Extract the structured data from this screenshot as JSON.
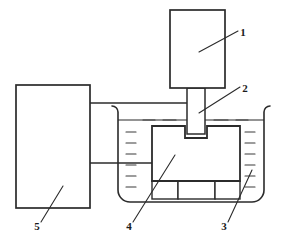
{
  "figure": {
    "kind": "technical-schematic",
    "background_color": "#ffffff",
    "line_color": "#2b2b2b",
    "fill_color": "#ffffff",
    "liquid_mark_color": "#3a3a3a"
  },
  "callouts": [
    {
      "id": "1",
      "label": "1",
      "target": "drive-unit-box",
      "text_x": 243,
      "text_y": 36,
      "leader": {
        "x1": 238,
        "y1": 31,
        "x2": 199,
        "y2": 52
      }
    },
    {
      "id": "2",
      "label": "2",
      "target": "plunger-rod",
      "text_x": 245,
      "text_y": 92,
      "leader": {
        "x1": 240,
        "y1": 87,
        "x2": 199,
        "y2": 113
      }
    },
    {
      "id": "3",
      "label": "3",
      "target": "liquid-tank",
      "text_x": 224,
      "text_y": 230,
      "leader": {
        "x1": 228,
        "y1": 222,
        "x2": 252,
        "y2": 170
      }
    },
    {
      "id": "4",
      "label": "4",
      "target": "workpiece-block",
      "text_x": 129,
      "text_y": 230,
      "leader": {
        "x1": 133,
        "y1": 222,
        "x2": 175,
        "y2": 155
      }
    },
    {
      "id": "5",
      "label": "5",
      "target": "controller-box",
      "text_x": 37,
      "text_y": 230,
      "leader": {
        "x1": 41,
        "y1": 222,
        "x2": 63,
        "y2": 186
      }
    }
  ],
  "parts": {
    "drive_unit": {
      "name": "drive-unit-box",
      "x": 170,
      "y": 10,
      "width": 55,
      "height": 78
    },
    "plunger_rod": {
      "name": "plunger-rod",
      "x": 187,
      "y": 88,
      "width": 18,
      "height": 46
    },
    "controller": {
      "name": "controller-box",
      "x": 16,
      "y": 85,
      "width": 74,
      "height": 123
    },
    "tank": {
      "name": "liquid-tank",
      "x": 118,
      "y": 112,
      "width": 146,
      "height": 90,
      "corner_radius": 12,
      "lip_radius": 6
    },
    "liquid_level_y": 120,
    "workpiece": {
      "name": "workpiece-block",
      "x": 152,
      "y": 126,
      "width": 88,
      "height": 55,
      "notch": {
        "x": 185,
        "y": 126,
        "width": 22,
        "height": 12
      }
    },
    "support_blocks": [
      {
        "x": 152,
        "y": 181,
        "width": 26,
        "height": 18
      },
      {
        "x": 178,
        "y": 181,
        "width": 37,
        "height": 18
      },
      {
        "x": 215,
        "y": 181,
        "width": 25,
        "height": 18
      }
    ],
    "connectors": [
      {
        "name": "upper-signal-line",
        "x1": 90,
        "y1": 103,
        "x2": 192,
        "y2": 103
      },
      {
        "name": "lower-signal-line",
        "x1": 90,
        "y1": 163,
        "x2": 155,
        "y2": 163
      }
    ],
    "liquid_marks": [
      {
        "x1": 126,
        "y1": 132,
        "x2": 136,
        "y2": 132
      },
      {
        "x1": 126,
        "y1": 143,
        "x2": 136,
        "y2": 143
      },
      {
        "x1": 126,
        "y1": 154,
        "x2": 136,
        "y2": 154
      },
      {
        "x1": 126,
        "y1": 165,
        "x2": 136,
        "y2": 165
      },
      {
        "x1": 126,
        "y1": 176,
        "x2": 136,
        "y2": 176
      },
      {
        "x1": 126,
        "y1": 187,
        "x2": 136,
        "y2": 187
      },
      {
        "x1": 245,
        "y1": 132,
        "x2": 255,
        "y2": 132
      },
      {
        "x1": 245,
        "y1": 143,
        "x2": 255,
        "y2": 143
      },
      {
        "x1": 245,
        "y1": 154,
        "x2": 255,
        "y2": 154
      },
      {
        "x1": 245,
        "y1": 165,
        "x2": 255,
        "y2": 165
      },
      {
        "x1": 245,
        "y1": 176,
        "x2": 255,
        "y2": 176
      },
      {
        "x1": 245,
        "y1": 187,
        "x2": 255,
        "y2": 187
      },
      {
        "x1": 143,
        "y1": 120,
        "x2": 155,
        "y2": 120
      },
      {
        "x1": 163,
        "y1": 120,
        "x2": 176,
        "y2": 120
      },
      {
        "x1": 214,
        "y1": 120,
        "x2": 228,
        "y2": 120
      },
      {
        "x1": 236,
        "y1": 120,
        "x2": 248,
        "y2": 120
      },
      {
        "x1": 186,
        "y1": 188,
        "x2": 200,
        "y2": 188
      },
      {
        "x1": 188,
        "y1": 194,
        "x2": 198,
        "y2": 194
      },
      {
        "x1": 224,
        "y1": 189,
        "x2": 234,
        "y2": 189
      }
    ]
  }
}
